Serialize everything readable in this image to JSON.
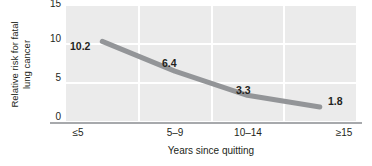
{
  "chart_data": {
    "type": "line",
    "title": "",
    "subtitle": "",
    "xlabel": "Years since quitting",
    "ylabel": "Relative risk for fatal lung cancer",
    "ylabel_lines": [
      "Relative risk for fatal",
      "lung cancer"
    ],
    "categories": [
      "≤5",
      "5–9",
      "10–14",
      "≥15"
    ],
    "values": [
      10.2,
      6.4,
      3.3,
      1.8
    ],
    "point_labels": [
      "10.2",
      "6.4",
      "3.3",
      "1.8"
    ],
    "ylim": [
      0,
      15
    ],
    "yticks": [
      0,
      5,
      10,
      15
    ],
    "ytick_labels": [
      "0",
      "5",
      "10",
      "15"
    ],
    "grid": true,
    "grid_color": "#ffffff",
    "plot_background": "#ebebeb",
    "legend": "none",
    "series": [
      {
        "name": "Relative risk for fatal lung cancer",
        "color": "#939598",
        "values": [
          10.2,
          6.4,
          3.3,
          1.8
        ]
      }
    ]
  },
  "axes": {
    "y_title_line1": "Relative risk for fatal",
    "y_title_line2": "lung cancer",
    "x_title": "Years since quitting",
    "y_tick_0": "0",
    "y_tick_1": "5",
    "y_tick_2": "10",
    "y_tick_3": "15",
    "x_tick_0": "≤5",
    "x_tick_1": "5–9",
    "x_tick_2": "10–14",
    "x_tick_3": "≥15"
  },
  "labels": {
    "p0": "10.2",
    "p1": "6.4",
    "p2": "3.3",
    "p3": "1.8"
  },
  "colors": {
    "line": "#939598",
    "plot_bg": "#ebebeb",
    "grid": "#ffffff",
    "axis": "#a7a9ac",
    "text": "#231f20"
  }
}
